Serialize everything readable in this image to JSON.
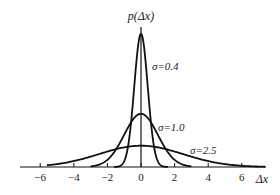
{
  "chart_data": {
    "type": "line",
    "title": "",
    "xlabel": "Δx",
    "ylabel": "p(Δx)",
    "xlim": [
      -7,
      7.5
    ],
    "xticks": [
      -6,
      -4,
      -2,
      0,
      2,
      4,
      6
    ],
    "xtick_labels": [
      "−6",
      "−4",
      "−2",
      "0",
      "2",
      "4",
      "6"
    ],
    "grid": false,
    "legend": "inline labels next to curves",
    "series": [
      {
        "name": "σ=0.4",
        "sigma": 0.4,
        "mean": 0,
        "peak": 0.997,
        "label_pos": [
          0.7,
          0.8
        ]
      },
      {
        "name": "σ=1.0",
        "sigma": 1.0,
        "mean": 0,
        "peak": 0.399,
        "label_pos": [
          1.1,
          0.12
        ]
      },
      {
        "name": "σ=2.5",
        "sigma": 2.5,
        "mean": 0,
        "peak": 0.16,
        "label_pos": [
          3.0,
          0.05
        ]
      }
    ],
    "x": [
      -6,
      -4,
      -2,
      -1,
      0,
      1,
      2,
      4,
      6
    ]
  },
  "labels": {
    "y_axis": "p(Δx)",
    "x_axis": "Δx",
    "curves": [
      "σ=0.4",
      "σ=1.0",
      "σ=2.5"
    ]
  },
  "colors": {
    "line": "#111111",
    "background": "#ffffff"
  }
}
